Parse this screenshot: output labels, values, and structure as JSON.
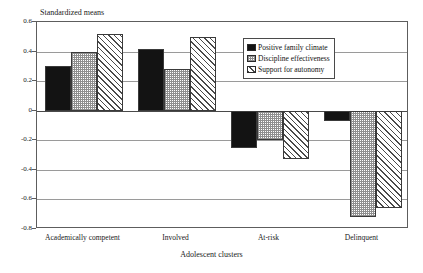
{
  "chart_data": {
    "type": "bar",
    "title": "",
    "ylabel": "Standardized means",
    "xlabel": "Adolescent clusters",
    "categories": [
      "Academically competent",
      "Involved",
      "At-risk",
      "Delinquent"
    ],
    "series": [
      {
        "name": "Positive family climate",
        "values": [
          0.3,
          0.42,
          -0.25,
          -0.07
        ],
        "fill": "solid"
      },
      {
        "name": "Discipline effectiveness",
        "values": [
          0.4,
          0.28,
          -0.2,
          -0.72
        ],
        "fill": "stipple"
      },
      {
        "name": "Support for autonomy",
        "values": [
          0.52,
          0.5,
          -0.33,
          -0.66
        ],
        "fill": "hatch"
      }
    ],
    "ylim": [
      -0.8,
      0.6
    ],
    "yticks": [
      0.6,
      0.4,
      0.2,
      0,
      -0.2,
      -0.4,
      -0.6,
      -0.8
    ],
    "ytick_labels": [
      "0.6",
      "0.4",
      "0.2",
      "0",
      "-0.2",
      "-0.4",
      "-0.6",
      "-0.8"
    ],
    "grid": true,
    "legend_position": "upper-right-inside",
    "colors": {
      "solid": "#131313",
      "stipple": "#8f8f8f",
      "hatch": "#4a4a4a",
      "frame": "#5d5d5d",
      "gridline": "#9a9a9a",
      "background": "#ffffff"
    }
  },
  "legend": {
    "items": [
      {
        "label": "Positive family climate"
      },
      {
        "label": "Discipline effectiveness"
      },
      {
        "label": "Support for autonomy"
      }
    ]
  }
}
